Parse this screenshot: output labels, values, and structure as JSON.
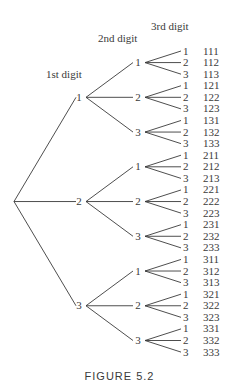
{
  "headers": {
    "level1": "1st digit",
    "level2": "2nd digit",
    "level3": "3rd digit"
  },
  "tree": {
    "digits": [
      "1",
      "2",
      "3"
    ],
    "outcomes": [
      "111",
      "112",
      "113",
      "121",
      "122",
      "123",
      "131",
      "132",
      "133",
      "211",
      "212",
      "213",
      "221",
      "222",
      "223",
      "231",
      "232",
      "233",
      "311",
      "312",
      "313",
      "321",
      "322",
      "323",
      "331",
      "332",
      "333"
    ]
  },
  "caption": "FIGURE 5.2",
  "colors": {
    "ink": "#3a3a3a",
    "background": "#ffffff"
  }
}
